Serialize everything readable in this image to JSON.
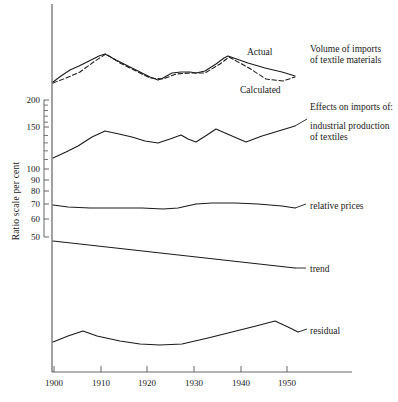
{
  "chart_data": {
    "type": "line",
    "title": "",
    "subtitle": "",
    "xlabel": "",
    "ylabel": "Ratio scale  per cent",
    "scale": "log",
    "grid": false,
    "legend_position": "right-inline",
    "xlim": [
      1900,
      1957
    ],
    "xticks": [
      1900,
      1910,
      1920,
      1930,
      1940,
      1950
    ],
    "xticklabels": [
      "1900",
      "1910",
      "1920",
      "1930",
      "1940",
      "1950"
    ],
    "yticks": [
      200,
      150,
      100,
      90,
      80,
      70,
      60,
      50
    ],
    "yticklabels": [
      "200",
      "150",
      "100",
      "90",
      "80",
      "70",
      "60",
      "50"
    ],
    "minor_yticks": [
      190,
      180,
      170,
      160,
      140,
      130,
      120,
      110
    ],
    "annotations": [
      {
        "name": "actual-label",
        "text": "Actual",
        "x": 247,
        "y": 47
      },
      {
        "name": "calculated-label",
        "text": "Calculated",
        "x": 240,
        "y": 85
      },
      {
        "name": "volume-heading",
        "text": "Volume of imports",
        "x": 310,
        "y": 44
      },
      {
        "name": "volume-heading-2",
        "text": "of textile materials",
        "x": 310,
        "y": 55
      },
      {
        "name": "effects-heading",
        "text": "Effects on imports of:",
        "x": 310,
        "y": 102
      },
      {
        "name": "industrial-label",
        "text": "industrial production",
        "x": 310,
        "y": 121
      },
      {
        "name": "industrial-label-2",
        "text": "of textiles",
        "x": 310,
        "y": 132
      },
      {
        "name": "relative-prices-label",
        "text": "relative prices",
        "x": 310,
        "y": 201
      },
      {
        "name": "trend-label",
        "text": "trend",
        "x": 310,
        "y": 264
      },
      {
        "name": "residual-label",
        "text": "residual",
        "x": 310,
        "y": 326
      }
    ],
    "series": [
      {
        "name": "Actual",
        "style": "solid",
        "color": "#1a1a1a",
        "x": [
          1900,
          1902,
          1904,
          1906,
          1908,
          1910,
          1911,
          1913,
          1916,
          1918,
          1920,
          1922,
          1923,
          1925,
          1927,
          1929,
          1930,
          1932,
          1934,
          1936,
          1937,
          1940,
          1944,
          1948,
          1952
        ],
        "points_px": [
          [
            53,
            82
          ],
          [
            61,
            76
          ],
          [
            70,
            70
          ],
          [
            79,
            66
          ],
          [
            89,
            61
          ],
          [
            99,
            56
          ],
          [
            105,
            54
          ],
          [
            116,
            60
          ],
          [
            128,
            66
          ],
          [
            140,
            72
          ],
          [
            150,
            77
          ],
          [
            158,
            80
          ],
          [
            163,
            78
          ],
          [
            172,
            73
          ],
          [
            181,
            72
          ],
          [
            190,
            72
          ],
          [
            196,
            73
          ],
          [
            205,
            71
          ],
          [
            216,
            64
          ],
          [
            224,
            58
          ],
          [
            228,
            56
          ],
          [
            248,
            63
          ],
          [
            265,
            68
          ],
          [
            282,
            72
          ],
          [
            295,
            76
          ]
        ]
      },
      {
        "name": "Calculated",
        "style": "dashed",
        "color": "#1a1a1a",
        "x": [
          1900,
          1903,
          1906,
          1909,
          1911,
          1914,
          1917,
          1920,
          1923,
          1926,
          1929,
          1932,
          1935,
          1937,
          1941,
          1945,
          1949,
          1952
        ],
        "points_px": [
          [
            53,
            83
          ],
          [
            66,
            78
          ],
          [
            80,
            72
          ],
          [
            95,
            61
          ],
          [
            106,
            54
          ],
          [
            120,
            63
          ],
          [
            134,
            70
          ],
          [
            150,
            78
          ],
          [
            163,
            79
          ],
          [
            176,
            74
          ],
          [
            190,
            73
          ],
          [
            205,
            73
          ],
          [
            220,
            64
          ],
          [
            229,
            57
          ],
          [
            249,
            68
          ],
          [
            266,
            79
          ],
          [
            283,
            81
          ],
          [
            295,
            77
          ]
        ]
      },
      {
        "name": "industrial production of textiles",
        "style": "solid",
        "color": "#1a1a1a",
        "x": [
          1900,
          1903,
          1906,
          1909,
          1911,
          1914,
          1917,
          1920,
          1923,
          1926,
          1929,
          1931,
          1933,
          1935,
          1937,
          1941,
          1945,
          1948,
          1952
        ],
        "points_px": [
          [
            53,
            158
          ],
          [
            66,
            152
          ],
          [
            78,
            146
          ],
          [
            92,
            137
          ],
          [
            105,
            131
          ],
          [
            119,
            134
          ],
          [
            132,
            137
          ],
          [
            145,
            141
          ],
          [
            158,
            143
          ],
          [
            170,
            139
          ],
          [
            181,
            135
          ],
          [
            188,
            139
          ],
          [
            196,
            142
          ],
          [
            207,
            135
          ],
          [
            216,
            129
          ],
          [
            232,
            136
          ],
          [
            246,
            142
          ],
          [
            262,
            136
          ],
          [
            295,
            126
          ]
        ]
      },
      {
        "name": "relative prices",
        "style": "solid",
        "color": "#1a1a1a",
        "x": [
          1900,
          1905,
          1910,
          1915,
          1920,
          1925,
          1928,
          1931,
          1934,
          1938,
          1944,
          1950,
          1955
        ],
        "points_px": [
          [
            53,
            205
          ],
          [
            68,
            207
          ],
          [
            90,
            208
          ],
          [
            115,
            208
          ],
          [
            142,
            208
          ],
          [
            163,
            209
          ],
          [
            178,
            208
          ],
          [
            196,
            204
          ],
          [
            212,
            203
          ],
          [
            235,
            203
          ],
          [
            258,
            204
          ],
          [
            282,
            206
          ],
          [
            295,
            208
          ]
        ]
      },
      {
        "name": "trend",
        "style": "solid",
        "color": "#1a1a1a",
        "x": [
          1900,
          1955
        ],
        "points_px": [
          [
            53,
            241
          ],
          [
            295,
            268
          ]
        ]
      },
      {
        "name": "residual",
        "style": "solid",
        "color": "#1a1a1a",
        "x": [
          1900,
          1903,
          1906,
          1910,
          1915,
          1920,
          1924,
          1928,
          1933,
          1938,
          1943,
          1947,
          1950,
          1953
        ],
        "points_px": [
          [
            53,
            342
          ],
          [
            68,
            336
          ],
          [
            83,
            331
          ],
          [
            97,
            336
          ],
          [
            120,
            341
          ],
          [
            140,
            344
          ],
          [
            160,
            345
          ],
          [
            182,
            344
          ],
          [
            208,
            338
          ],
          [
            232,
            332
          ],
          [
            256,
            326
          ],
          [
            275,
            321
          ],
          [
            288,
            327
          ],
          [
            298,
            332
          ]
        ]
      }
    ]
  },
  "axes": {
    "y_axis_title": "Ratio scale  per cent",
    "y_labels": [
      {
        "value": "200",
        "y": 100
      },
      {
        "value": "150",
        "y": 127
      },
      {
        "value": "100",
        "y": 169
      },
      {
        "value": "90",
        "y": 180
      },
      {
        "value": "80",
        "y": 191
      },
      {
        "value": "70",
        "y": 204
      },
      {
        "value": "60",
        "y": 219
      },
      {
        "value": "50",
        "y": 237
      }
    ],
    "x_labels": [
      {
        "value": "1900",
        "x": 45
      },
      {
        "value": "1910",
        "x": 92
      },
      {
        "value": "1920",
        "x": 138
      },
      {
        "value": "1930",
        "x": 185
      },
      {
        "value": "1940",
        "x": 232
      },
      {
        "value": "1950",
        "x": 278
      }
    ]
  },
  "colors": {
    "line": "#1a1a1a",
    "axis": "#555555",
    "background": "#ffffff"
  }
}
